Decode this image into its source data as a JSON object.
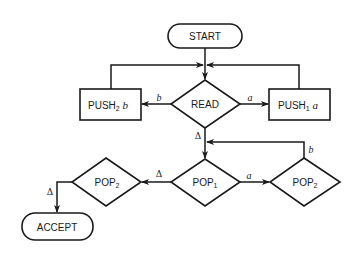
{
  "diagram": {
    "type": "flowchart",
    "nodes": {
      "start": {
        "label": "START",
        "shape": "terminal"
      },
      "read": {
        "label": "READ",
        "shape": "decision"
      },
      "push2": {
        "label": "PUSH",
        "sub": "2",
        "arg": "b",
        "shape": "process"
      },
      "push1": {
        "label": "PUSH",
        "sub": "1",
        "arg": "a",
        "shape": "process"
      },
      "pop1": {
        "label": "POP",
        "sub": "1",
        "shape": "decision"
      },
      "pop2_right": {
        "label": "POP",
        "sub": "2",
        "shape": "decision"
      },
      "pop2_left": {
        "label": "POP",
        "sub": "2",
        "shape": "decision"
      },
      "accept": {
        "label": "ACCEPT",
        "shape": "terminal"
      }
    },
    "edges": [
      {
        "from": "start",
        "to": "read",
        "label": ""
      },
      {
        "from": "read",
        "to": "push2",
        "label": "b"
      },
      {
        "from": "read",
        "to": "push1",
        "label": "a"
      },
      {
        "from": "push2",
        "to": "read",
        "label": ""
      },
      {
        "from": "push1",
        "to": "read",
        "label": ""
      },
      {
        "from": "read",
        "to": "pop1",
        "label": "Δ"
      },
      {
        "from": "pop1",
        "to": "pop2_right",
        "label": "a"
      },
      {
        "from": "pop2_right",
        "to": "pop1",
        "label": "b"
      },
      {
        "from": "pop1",
        "to": "pop2_left",
        "label": "Δ"
      },
      {
        "from": "pop2_left",
        "to": "accept",
        "label": "Δ"
      }
    ],
    "edge_labels": {
      "read_to_push2": "b",
      "read_to_push1": "a",
      "read_to_pop1": "Δ",
      "pop1_to_pop2_right": "a",
      "pop2_right_to_pop1": "b",
      "pop1_to_pop2_left": "Δ",
      "pop2_left_to_accept": "Δ"
    }
  }
}
